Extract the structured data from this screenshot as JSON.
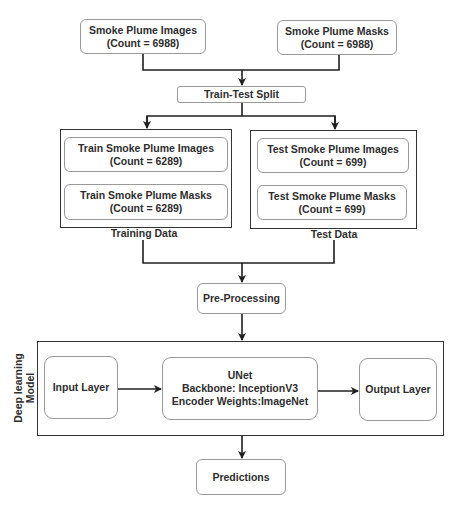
{
  "inputs": {
    "images": {
      "title": "Smoke Plume Images",
      "count": "(Count = 6988)"
    },
    "masks": {
      "title": "Smoke Plume Masks",
      "count": "(Count = 6988)"
    }
  },
  "split": {
    "label": "Train-Test Split"
  },
  "training": {
    "group_label": "Training Data",
    "images": {
      "title": "Train Smoke Plume Images",
      "count": "(Count = 6289)"
    },
    "masks": {
      "title": "Train Smoke Plume Masks",
      "count": "(Count = 6289)"
    }
  },
  "test": {
    "group_label": "Test Data",
    "images": {
      "title": "Test Smoke Plume Images",
      "count": "(Count = 699)"
    },
    "masks": {
      "title": "Test Smoke Plume Masks",
      "count": "(Count = 699)"
    }
  },
  "preprocessing": {
    "label": "Pre-Processing"
  },
  "model": {
    "group_label_line1": "Deep learning",
    "group_label_line2": "Model",
    "input_layer": "Input Layer",
    "unet": {
      "name": "UNet",
      "backbone": "Backbone: InceptionV3",
      "weights": "Encoder Weights:ImageNet"
    },
    "output_layer": "Output Layer"
  },
  "predictions": {
    "label": "Predictions"
  },
  "colors": {
    "line": "#1f1f1f",
    "box_border": "#9a9a9a",
    "group_border": "#333333"
  }
}
